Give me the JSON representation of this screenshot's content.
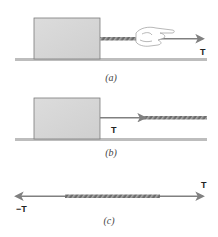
{
  "figure": {
    "panels": [
      {
        "id": "a",
        "caption": "(a)",
        "description": "Hand pulling a rope attached to a block resting on a surface",
        "force_labels": [
          "T"
        ]
      },
      {
        "id": "b",
        "caption": "(b)",
        "description": "Rope exerts tension force on block",
        "force_labels": [
          "T"
        ]
      },
      {
        "id": "c",
        "caption": "(c)",
        "description": "Rope segment with equal and opposite tension forces at its ends",
        "force_labels": [
          "T",
          "−T"
        ]
      }
    ]
  },
  "colors": {
    "block_fill": "#d8d8d8",
    "block_stroke": "#7a7a7a",
    "ground": "#bdbdbd",
    "rope": "#6d6d6d",
    "rope_hatch": "#9a9a9a",
    "arrow": "#808080",
    "hand_stroke": "#999999"
  }
}
